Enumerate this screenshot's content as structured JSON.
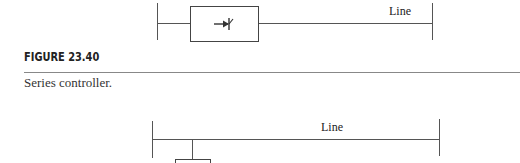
{
  "figure_top": {
    "line_label": "Line",
    "device_icon": "thyristor-arrow-icon"
  },
  "figure_caption": {
    "number": "FIGURE 23.40",
    "caption": "Series controller."
  },
  "figure_bottom": {
    "line_label": "Line"
  },
  "colors": {
    "line": "#555555",
    "text": "#222222",
    "rule": "#888888"
  }
}
